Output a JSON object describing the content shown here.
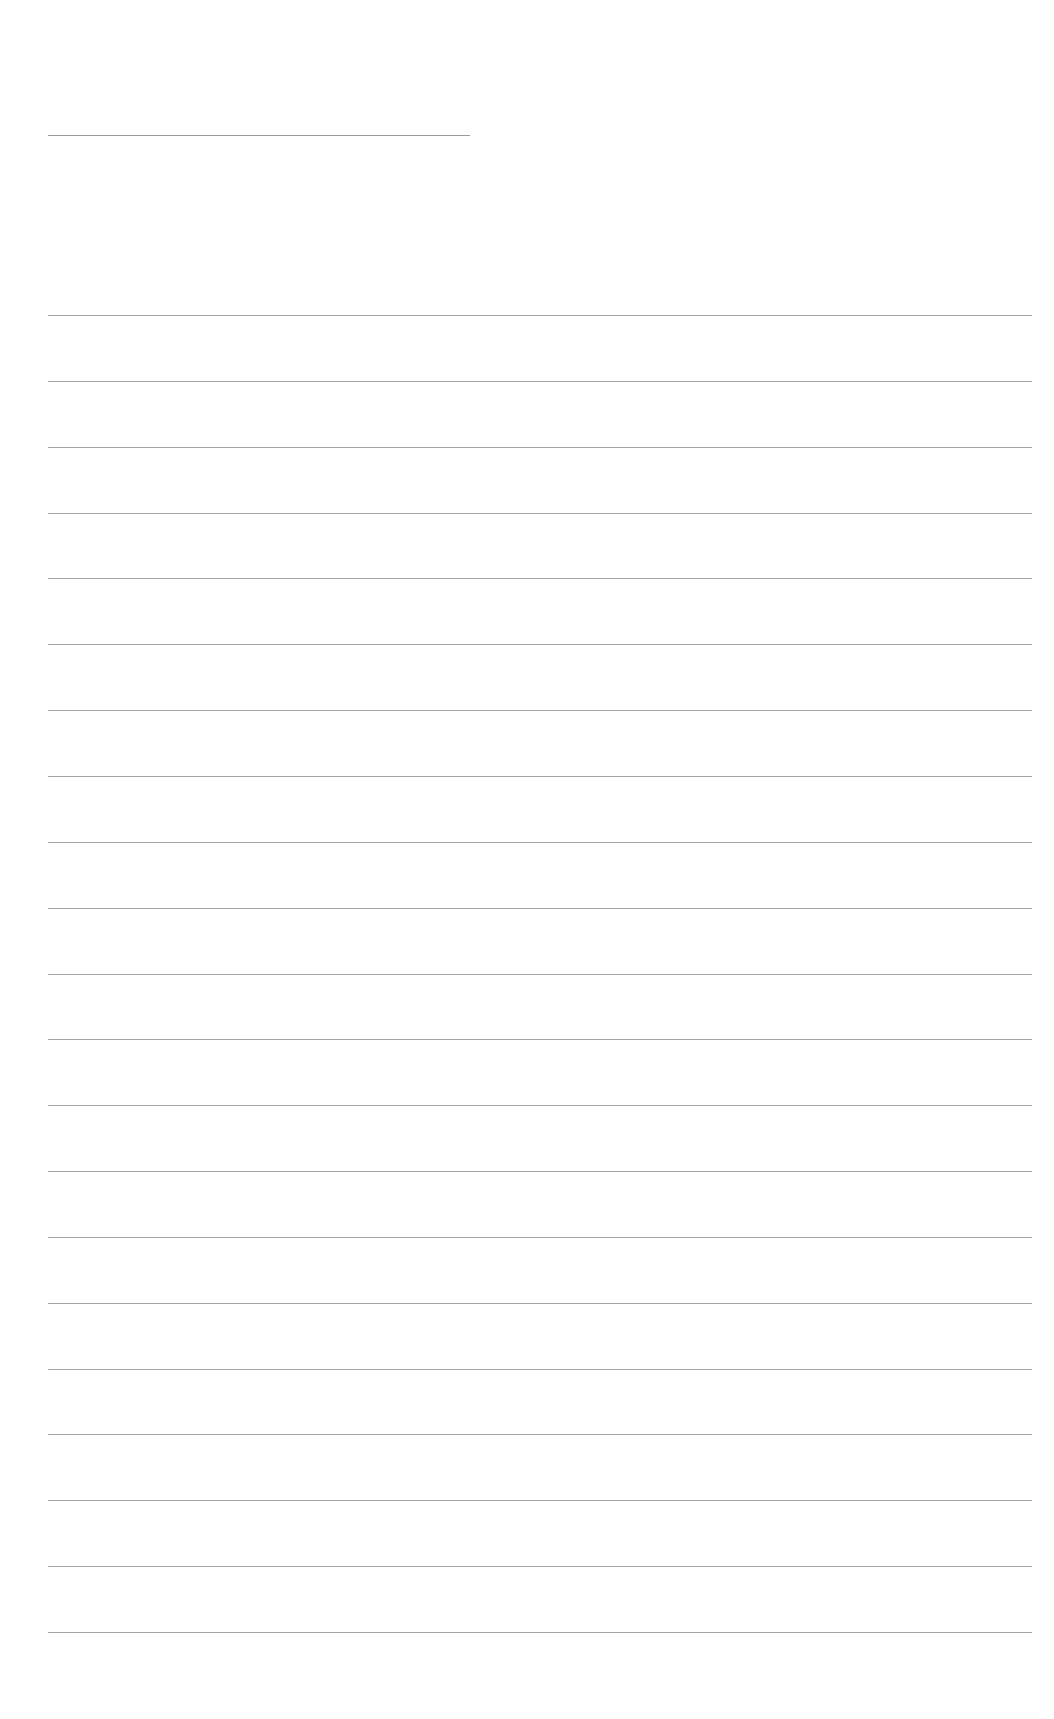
{
  "page": {
    "type": "blank lined writing page",
    "title_line": {
      "present": true
    },
    "ruled_lines": {
      "count": 21
    },
    "colors": {
      "background": "#ffffff",
      "line": "#a3a3a3"
    }
  }
}
